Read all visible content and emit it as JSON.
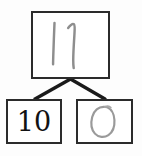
{
  "diagram": {
    "type": "number-bond",
    "background_color": "#fdfdfd",
    "box_border_color": "#2b2b2b",
    "connector_color": "#1a1a1a",
    "handwriting_color": "#8c8c8c",
    "typed_color": "#121212",
    "parent": {
      "name": "whole",
      "value": "11",
      "style": "handwritten",
      "stroke_count": "2"
    },
    "children": [
      {
        "name": "part-left",
        "value": "10",
        "style": "typed"
      },
      {
        "name": "part-right",
        "value": "0",
        "style": "handwritten"
      }
    ],
    "connectors": [
      {
        "name": "connector-left",
        "from": "parent",
        "to": "part-left"
      },
      {
        "name": "connector-right",
        "from": "parent",
        "to": "part-right"
      }
    ]
  }
}
